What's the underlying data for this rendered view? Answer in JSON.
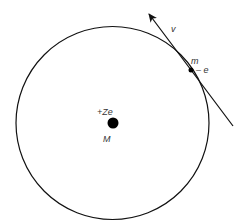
{
  "diagram": {
    "orbit": {
      "cx": 112.5,
      "cy": 123,
      "r": 96.5
    },
    "nucleus": {
      "cx": 113,
      "cy": 123,
      "r": 5.5,
      "charge_label": "+Ze",
      "mass_label": "M"
    },
    "electron": {
      "cx": 191,
      "cy": 70,
      "r": 2.5,
      "mass_label": "m",
      "charge_label": "– e"
    },
    "velocity": {
      "label": "v",
      "x1": 233,
      "y1": 126,
      "x2": 148,
      "y2": 13
    },
    "colors": {
      "stroke": "#111111",
      "text": "#333333"
    }
  }
}
